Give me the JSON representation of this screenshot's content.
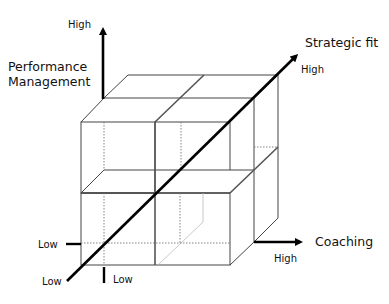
{
  "diagram": {
    "type": "3d-cube-matrix",
    "axes": {
      "vertical": {
        "title_line1": "Performance",
        "title_line2": "Management",
        "high_label": "High",
        "low_label": "Low"
      },
      "horizontal": {
        "title": "Coaching",
        "high_label": "High",
        "low_label": "Low"
      },
      "diagonal": {
        "title": "Strategic fit",
        "high_label": "High",
        "low_label": "Low"
      }
    },
    "colors": {
      "axis": "#000000",
      "edges": "#444444",
      "background": "#ffffff"
    }
  }
}
